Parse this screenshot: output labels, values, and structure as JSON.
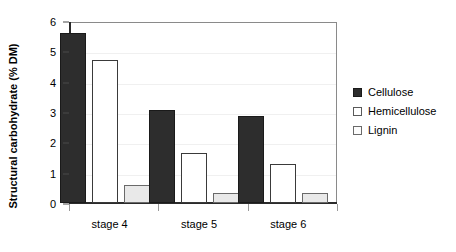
{
  "chart_data": {
    "type": "bar",
    "title": "",
    "xlabel": "",
    "ylabel": "Structural carbohydrate (% DM)",
    "categories": [
      "stage 4",
      "stage 5",
      "stage 6"
    ],
    "series": [
      {
        "name": "Cellulose",
        "values": [
          5.6,
          3.05,
          2.88
        ]
      },
      {
        "name": "Hemicellulose",
        "values": [
          4.7,
          1.65,
          1.28
        ]
      },
      {
        "name": "Lignin",
        "values": [
          0.58,
          0.32,
          0.33
        ]
      }
    ],
    "ylim": [
      0,
      6
    ],
    "yticks": [
      "0",
      "1",
      "2",
      "3",
      "4",
      "5",
      "6"
    ],
    "grid": true,
    "legend_position": "right",
    "colors": {
      "cellulose": "#2d2d2d",
      "hemicellulose": "#ffffff",
      "lignin": "#e9e9e9",
      "axis": "#2b2b2b",
      "frame": "#8a8a8a",
      "gridline": "#f0f0f0"
    }
  },
  "legend": {
    "items": [
      {
        "label": "Cellulose"
      },
      {
        "label": "Hemicellulose"
      },
      {
        "label": "Lignin"
      }
    ]
  }
}
